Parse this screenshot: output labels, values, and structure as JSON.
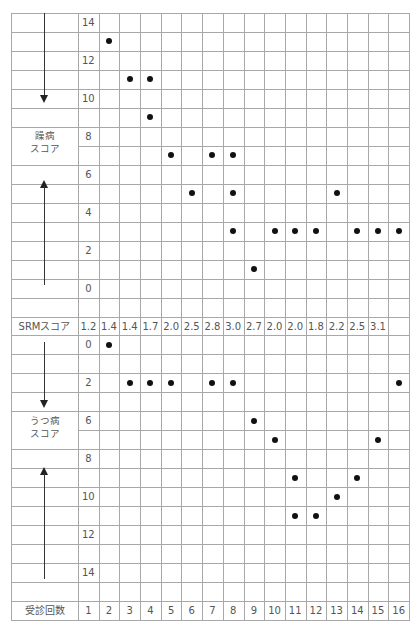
{
  "chart_data": {
    "type": "scatter",
    "title": "",
    "xlabel": "受診回数",
    "visits": [
      1,
      2,
      3,
      4,
      5,
      6,
      7,
      8,
      9,
      10,
      11,
      12,
      13,
      14,
      15,
      16
    ],
    "srm_label": "SRMスコア",
    "srm_scores": [
      "1.2",
      "1.4",
      "1.4",
      "1.7",
      "2.0",
      "2.5",
      "2.8",
      "3.0",
      "2.7",
      "2.0",
      "2.0",
      "1.8",
      "2.2",
      "2.5",
      "3.1",
      ""
    ],
    "panels": [
      {
        "name": "躁病スコア",
        "ylabel": "躁病\nスコア",
        "y_tick_labels": [
          "14",
          "",
          "12",
          "",
          "10",
          "",
          "8",
          "",
          "6",
          "",
          "4",
          "",
          "2",
          "",
          "0"
        ],
        "ylim": [
          0,
          14
        ],
        "direction_arrows": [
          "down (top)",
          "up (bottom)"
        ],
        "points": [
          {
            "visit": 2,
            "value": 13
          },
          {
            "visit": 3,
            "value": 11
          },
          {
            "visit": 4,
            "value": 11
          },
          {
            "visit": 4,
            "value": 9
          },
          {
            "visit": 5,
            "value": 7
          },
          {
            "visit": 6,
            "value": 5
          },
          {
            "visit": 7,
            "value": 7
          },
          {
            "visit": 8,
            "value": 7
          },
          {
            "visit": 8,
            "value": 5
          },
          {
            "visit": 8,
            "value": 3
          },
          {
            "visit": 9,
            "value": 1
          },
          {
            "visit": 10,
            "value": 3
          },
          {
            "visit": 11,
            "value": 3
          },
          {
            "visit": 12,
            "value": 3
          },
          {
            "visit": 13,
            "value": 5
          },
          {
            "visit": 14,
            "value": 3
          },
          {
            "visit": 15,
            "value": 3
          },
          {
            "visit": 16,
            "value": 3
          }
        ]
      },
      {
        "name": "うつ病スコア",
        "ylabel": "うつ病\nスコア",
        "y_tick_labels": [
          "0",
          "",
          "2",
          "",
          "6",
          "",
          "8",
          "",
          "10",
          "",
          "12",
          "",
          "14",
          ""
        ],
        "ylim": [
          0,
          14
        ],
        "direction_arrows": [
          "down (top)",
          "up (bottom)"
        ],
        "points": [
          {
            "visit": 2,
            "row": 0,
            "value": 0
          },
          {
            "visit": 3,
            "row": 2,
            "value": 2
          },
          {
            "visit": 4,
            "row": 2,
            "value": 2
          },
          {
            "visit": 5,
            "row": 2,
            "value": 2
          },
          {
            "visit": 7,
            "row": 2,
            "value": 2
          },
          {
            "visit": 8,
            "row": 2,
            "value": 2
          },
          {
            "visit": 9,
            "row": 4,
            "value": 6
          },
          {
            "visit": 10,
            "row": 5,
            "value": 7
          },
          {
            "visit": 11,
            "row": 7,
            "value": 9
          },
          {
            "visit": 11,
            "row": 9,
            "value": 11
          },
          {
            "visit": 12,
            "row": 9,
            "value": 11
          },
          {
            "visit": 13,
            "row": 8,
            "value": 10
          },
          {
            "visit": 14,
            "row": 7,
            "value": 9
          },
          {
            "visit": 15,
            "row": 5,
            "value": 7
          },
          {
            "visit": 16,
            "row": 2,
            "value": 2
          }
        ]
      }
    ]
  },
  "labels": {
    "mania_line1": "躁病",
    "mania_line2": "スコア",
    "depression_line1": "うつ病",
    "depression_line2": "スコア",
    "srm": "SRMスコア",
    "visits": "受診回数"
  },
  "colors": {
    "grid": "#a8a8a8",
    "dot": "#111111",
    "text": "#555555"
  }
}
